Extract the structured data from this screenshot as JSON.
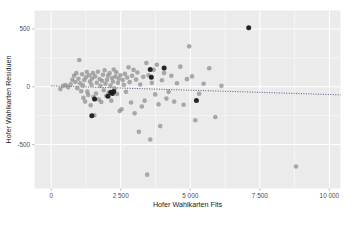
{
  "chart_data": {
    "type": "scatter",
    "title": "",
    "xlabel": "Hofer Wahlkarten Fits",
    "ylabel": "Hofer Wahlkarten Residuen",
    "xlim": [
      -600,
      10400
    ],
    "ylim": [
      -880,
      660
    ],
    "xticks": [
      0,
      2500,
      5000,
      7500,
      10000
    ],
    "xticklabels": [
      "0",
      "2 500",
      "5 000",
      "7 500",
      "10 000"
    ],
    "yticks": [
      500,
      0,
      -500
    ],
    "yticklabels": [
      "500",
      "0",
      "-500"
    ],
    "x_minor_ticks": [
      1250,
      3750,
      6250,
      8750
    ],
    "y_minor_ticks": [
      250,
      -250
    ],
    "grid": true,
    "legend_position": "none",
    "panel_color": "#ebebeb",
    "grid_color": "#ffffff",
    "point_color": "#8c8c8c",
    "highlight_color": "#1a1a1a",
    "reference_line_color": "#3c3c6e",
    "reference_line": {
      "style": "dotted",
      "x_start": 0,
      "y_start": 8,
      "x_end": 10400,
      "y_end": -70
    },
    "series": [
      {
        "name": "Residuen",
        "marker": "circle",
        "color": "#8c8c8c",
        "points": [
          [
            330,
            -20
          ],
          [
            430,
            8
          ],
          [
            520,
            14
          ],
          [
            610,
            -5
          ],
          [
            700,
            22
          ],
          [
            760,
            60
          ],
          [
            820,
            95
          ],
          [
            870,
            42
          ],
          [
            900,
            118
          ],
          [
            940,
            -12
          ],
          [
            980,
            70
          ],
          [
            1010,
            232
          ],
          [
            1040,
            30
          ],
          [
            1080,
            -38
          ],
          [
            1110,
            108
          ],
          [
            1140,
            12
          ],
          [
            1160,
            -96
          ],
          [
            1190,
            58
          ],
          [
            1220,
            -128
          ],
          [
            1250,
            82
          ],
          [
            1280,
            128
          ],
          [
            1300,
            -42
          ],
          [
            1330,
            -70
          ],
          [
            1360,
            100
          ],
          [
            1390,
            46
          ],
          [
            1420,
            -160
          ],
          [
            1450,
            18
          ],
          [
            1470,
            72
          ],
          [
            1500,
            118
          ],
          [
            1520,
            -88
          ],
          [
            1550,
            -246
          ],
          [
            1580,
            90
          ],
          [
            1610,
            -58
          ],
          [
            1640,
            35
          ],
          [
            1680,
            130
          ],
          [
            1710,
            -110
          ],
          [
            1740,
            68
          ],
          [
            1770,
            8
          ],
          [
            1800,
            -132
          ],
          [
            1830,
            52
          ],
          [
            1860,
            104
          ],
          [
            1890,
            -30
          ],
          [
            1920,
            142
          ],
          [
            1950,
            26
          ],
          [
            1980,
            -78
          ],
          [
            2010,
            60
          ],
          [
            2040,
            96
          ],
          [
            2070,
            -50
          ],
          [
            2100,
            118
          ],
          [
            2130,
            10
          ],
          [
            2160,
            -120
          ],
          [
            2190,
            76
          ],
          [
            2220,
            44
          ],
          [
            2250,
            150
          ],
          [
            2280,
            -16
          ],
          [
            2310,
            88
          ],
          [
            2340,
            126
          ],
          [
            2370,
            -62
          ],
          [
            2400,
            34
          ],
          [
            2430,
            70
          ],
          [
            2460,
            -210
          ],
          [
            2490,
            100
          ],
          [
            2530,
            -194
          ],
          [
            2570,
            58
          ],
          [
            2610,
            18
          ],
          [
            2650,
            112
          ],
          [
            2690,
            -44
          ],
          [
            2730,
            80
          ],
          [
            2780,
            168
          ],
          [
            2820,
            40
          ],
          [
            2870,
            -136
          ],
          [
            2910,
            96
          ],
          [
            2960,
            146
          ],
          [
            3000,
            -230
          ],
          [
            3050,
            62
          ],
          [
            3100,
            124
          ],
          [
            3150,
            -390
          ],
          [
            3200,
            20
          ],
          [
            3260,
            -170
          ],
          [
            3310,
            86
          ],
          [
            3360,
            -120
          ],
          [
            3420,
            206
          ],
          [
            3450,
            -760
          ],
          [
            3500,
            100
          ],
          [
            3560,
            -456
          ],
          [
            3620,
            34
          ],
          [
            3680,
            148
          ],
          [
            3740,
            -66
          ],
          [
            3800,
            190
          ],
          [
            3860,
            -152
          ],
          [
            3920,
            -340
          ],
          [
            3980,
            56
          ],
          [
            4060,
            120
          ],
          [
            4140,
            -102
          ],
          [
            4220,
            -44
          ],
          [
            4320,
            96
          ],
          [
            4420,
            -128
          ],
          [
            4520,
            30
          ],
          [
            4640,
            174
          ],
          [
            4760,
            -156
          ],
          [
            4880,
            66
          ],
          [
            4960,
            350
          ],
          [
            5060,
            90
          ],
          [
            5180,
            -290
          ],
          [
            5320,
            -60
          ],
          [
            5480,
            26
          ],
          [
            5680,
            160
          ],
          [
            5900,
            -262
          ],
          [
            6120,
            8
          ],
          [
            8800,
            -690
          ]
        ]
      },
      {
        "name": "Hervorgehoben",
        "marker": "circle",
        "color": "#1a1a1a",
        "points": [
          [
            1460,
            -250
          ],
          [
            1560,
            -105
          ],
          [
            2040,
            -82
          ],
          [
            2140,
            -48
          ],
          [
            2200,
            -58
          ],
          [
            2250,
            -40
          ],
          [
            3560,
            150
          ],
          [
            3600,
            82
          ],
          [
            4060,
            162
          ],
          [
            5220,
            -118
          ],
          [
            7100,
            510
          ]
        ]
      }
    ]
  }
}
